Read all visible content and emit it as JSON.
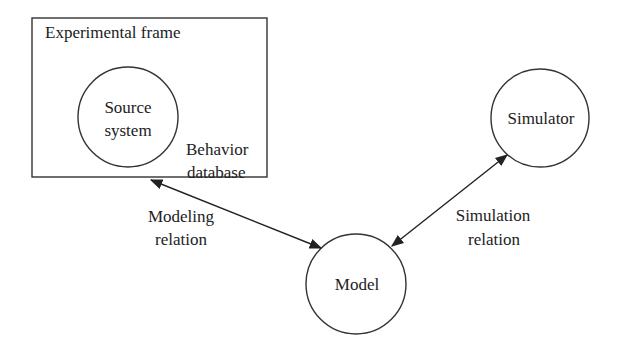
{
  "diagram": {
    "frame": {
      "label": "Experimental frame",
      "behavior_label_line1": "Behavior",
      "behavior_label_line2": "database"
    },
    "nodes": {
      "source": {
        "line1": "Source",
        "line2": "system"
      },
      "model": {
        "label": "Model"
      },
      "simulator": {
        "label": "Simulator"
      }
    },
    "edges": {
      "modeling": {
        "line1": "Modeling",
        "line2": "relation",
        "direction": "bidirectional",
        "from": "Experimental frame",
        "to": "Model"
      },
      "simulation": {
        "line1": "Simulation",
        "line2": "relation",
        "direction": "bidirectional",
        "from": "Simulator",
        "to": "Model"
      }
    },
    "colors": {
      "stroke": "#333333",
      "text": "#222222",
      "background": "#ffffff"
    }
  }
}
